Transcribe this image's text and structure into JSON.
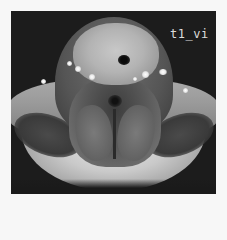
{
  "image": {
    "type": "axial MRI slice of the neck",
    "sequence_label": "t1_vi",
    "colors": {
      "page_background": "#f7f7f7",
      "scan_background": "#1c1c1c",
      "label_text": "#dcdcdc"
    },
    "features": {
      "anterior_bright_region": "thyroid / anterior neck mass",
      "trachea": "dark airway lumen",
      "vessels": "bright dots bilaterally",
      "posterior": "paraspinal muscles with midline"
    }
  }
}
